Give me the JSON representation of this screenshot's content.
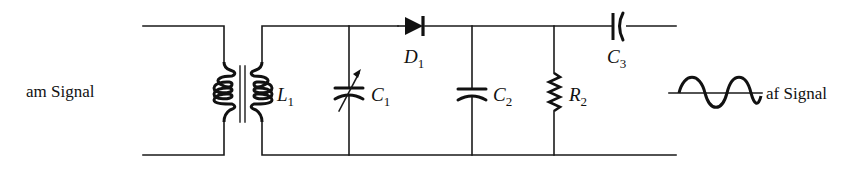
{
  "diagram": {
    "type": "circuit-schematic",
    "input_label": "am Signal",
    "output_label": "af Signal",
    "components": [
      {
        "id": "L1",
        "letter": "L",
        "sub": "1",
        "kind": "transformer"
      },
      {
        "id": "C1",
        "letter": "C",
        "sub": "1",
        "kind": "variable-capacitor"
      },
      {
        "id": "D1",
        "letter": "D",
        "sub": "1",
        "kind": "diode"
      },
      {
        "id": "C2",
        "letter": "C",
        "sub": "2",
        "kind": "capacitor"
      },
      {
        "id": "R2",
        "letter": "R",
        "sub": "2",
        "kind": "resistor"
      },
      {
        "id": "C3",
        "letter": "C",
        "sub": "3",
        "kind": "capacitor"
      }
    ],
    "colors": {
      "ink": "#111111",
      "background": "#ffffff"
    }
  }
}
